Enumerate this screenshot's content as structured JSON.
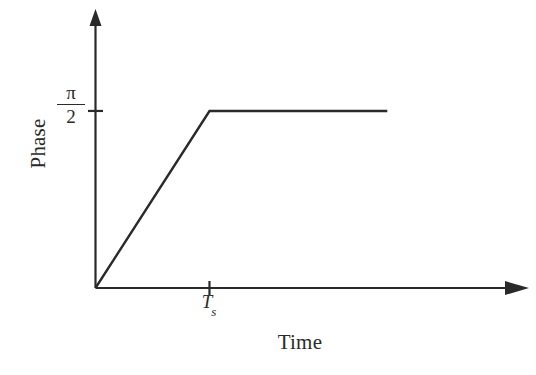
{
  "figure": {
    "background_color": "#ffffff",
    "line_color": "#2a2a2a",
    "axis_color": "#2a2a2a"
  },
  "labels": {
    "ylabel": "Phase",
    "xlabel": "Time",
    "ytick_numerator": "π",
    "ytick_denominator": "2",
    "xtick_symbol": "T",
    "xtick_subscript": "s"
  },
  "chart_data": {
    "type": "line",
    "title": "",
    "subtitle": "",
    "xlabel": "Time",
    "ylabel": "Phase",
    "xlim": [
      0,
      3.65
    ],
    "ylim": [
      0,
      2.36
    ],
    "grid": false,
    "legend": null,
    "xticks": [
      {
        "value": 1.0,
        "label": "T_s"
      }
    ],
    "yticks": [
      {
        "value": 1.5708,
        "label": "π/2"
      }
    ],
    "axis_style": {
      "spines": "two-axis-arrows",
      "x_axis_arrow": true,
      "y_axis_arrow": true
    },
    "annotations": [],
    "series": [
      {
        "name": "Phase vs Time",
        "x": [
          0.0,
          1.0,
          2.56
        ],
        "y": [
          0.0,
          1.5708,
          1.5708
        ],
        "description": "Linear ramp from origin to pi/2 at T_s, then constant at pi/2",
        "color": "#2a2a2a",
        "linewidth": 2
      }
    ]
  }
}
